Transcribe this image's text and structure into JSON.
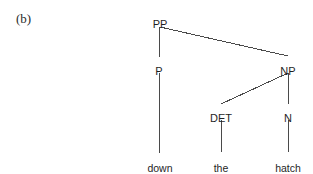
{
  "figure": {
    "label": "(b)",
    "background_color": "#ffffff",
    "line_color": "#4a4a4a",
    "text_color": "#1f1f1f"
  },
  "chart_data": {
    "type": "diagram",
    "diagram_kind": "syntax-tree",
    "title": "(b)",
    "sentence": "down the hatch",
    "nodes": [
      {
        "id": "PP",
        "label": "PP",
        "x": 160,
        "y": 18,
        "level": 0,
        "kind": "phrase"
      },
      {
        "id": "P",
        "label": "P",
        "x": 159,
        "y": 65,
        "level": 1,
        "kind": "head"
      },
      {
        "id": "NP",
        "label": "NP",
        "x": 288,
        "y": 65,
        "level": 1,
        "kind": "phrase"
      },
      {
        "id": "DET",
        "label": "DET",
        "x": 221,
        "y": 112,
        "level": 2,
        "kind": "head"
      },
      {
        "id": "N",
        "label": "N",
        "x": 288,
        "y": 112,
        "level": 2,
        "kind": "head"
      },
      {
        "id": "down",
        "label": "down",
        "x": 160,
        "y": 162,
        "level": 3,
        "kind": "terminal"
      },
      {
        "id": "the",
        "label": "the",
        "x": 221,
        "y": 162,
        "level": 3,
        "kind": "terminal"
      },
      {
        "id": "hatch",
        "label": "hatch",
        "x": 288,
        "y": 162,
        "level": 3,
        "kind": "terminal"
      }
    ],
    "edges": [
      {
        "from": "PP",
        "to": "P",
        "x1": 159,
        "y1": 27,
        "x2": 159,
        "y2": 57
      },
      {
        "from": "PP",
        "to": "NP",
        "x1": 160,
        "y1": 27,
        "x2": 288,
        "y2": 56
      },
      {
        "from": "P",
        "to": "down",
        "x1": 159,
        "y1": 73,
        "x2": 159,
        "y2": 153
      },
      {
        "from": "NP",
        "to": "DET",
        "x1": 288,
        "y1": 73,
        "x2": 221,
        "y2": 104
      },
      {
        "from": "NP",
        "to": "N",
        "x1": 288,
        "y1": 73,
        "x2": 288,
        "y2": 104
      },
      {
        "from": "DET",
        "to": "the",
        "x1": 221,
        "y1": 120,
        "x2": 221,
        "y2": 152
      },
      {
        "from": "N",
        "to": "hatch",
        "x1": 288,
        "y1": 120,
        "x2": 288,
        "y2": 152
      }
    ]
  }
}
